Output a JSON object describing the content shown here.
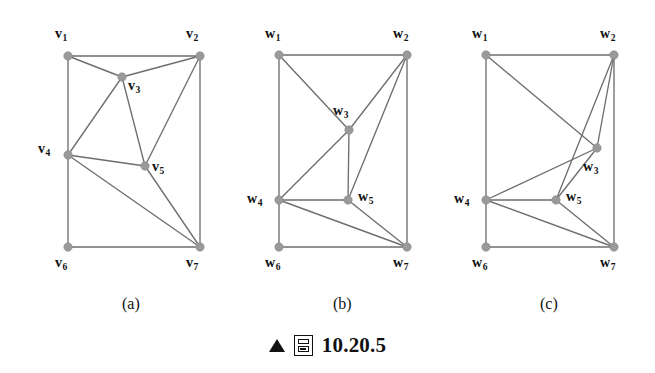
{
  "figure": {
    "caption": {
      "triangle_marker": "triangle-up-marker",
      "box_icon": "figure-box-icon",
      "number": "10.20.5"
    },
    "subfigures": [
      {
        "id": "a",
        "label": "(a)",
        "label_x": 122,
        "label_y": 295,
        "vertex_prefix": "v",
        "vertices": [
          {
            "name": "v1",
            "label": "v",
            "sub": "1",
            "x": 68,
            "y": 56,
            "lx": 55,
            "ly": 27
          },
          {
            "name": "v2",
            "label": "v",
            "sub": "2",
            "x": 200,
            "y": 56,
            "lx": 186,
            "ly": 27
          },
          {
            "name": "v3",
            "label": "v",
            "sub": "3",
            "x": 122,
            "y": 77,
            "lx": 128,
            "ly": 79
          },
          {
            "name": "v4",
            "label": "v",
            "sub": "4",
            "x": 68,
            "y": 155,
            "lx": 38,
            "ly": 142
          },
          {
            "name": "v5",
            "label": "v",
            "sub": "5",
            "x": 145,
            "y": 166,
            "lx": 152,
            "ly": 160
          },
          {
            "name": "v6",
            "label": "v",
            "sub": "6",
            "x": 68,
            "y": 247,
            "lx": 55,
            "ly": 256
          },
          {
            "name": "v7",
            "label": "v",
            "sub": "7",
            "x": 200,
            "y": 247,
            "lx": 186,
            "ly": 256
          }
        ],
        "edges": [
          [
            "v1",
            "v2"
          ],
          [
            "v1",
            "v3"
          ],
          [
            "v1",
            "v4"
          ],
          [
            "v2",
            "v3"
          ],
          [
            "v2",
            "v5"
          ],
          [
            "v2",
            "v7"
          ],
          [
            "v3",
            "v4"
          ],
          [
            "v3",
            "v5"
          ],
          [
            "v4",
            "v5"
          ],
          [
            "v4",
            "v6"
          ],
          [
            "v4",
            "v7"
          ],
          [
            "v5",
            "v7"
          ],
          [
            "v6",
            "v7"
          ]
        ]
      },
      {
        "id": "b",
        "label": "(b)",
        "label_x": 333,
        "label_y": 295,
        "vertex_prefix": "w",
        "vertices": [
          {
            "name": "w1",
            "label": "w",
            "sub": "1",
            "x": 279,
            "y": 55,
            "lx": 265,
            "ly": 27
          },
          {
            "name": "w2",
            "label": "w",
            "sub": "2",
            "x": 407,
            "y": 55,
            "lx": 393,
            "ly": 27
          },
          {
            "name": "w3",
            "label": "w",
            "sub": "3",
            "x": 349,
            "y": 130,
            "lx": 333,
            "ly": 104
          },
          {
            "name": "w4",
            "label": "w",
            "sub": "4",
            "x": 279,
            "y": 200,
            "lx": 247,
            "ly": 192
          },
          {
            "name": "w5",
            "label": "w",
            "sub": "5",
            "x": 348,
            "y": 200,
            "lx": 358,
            "ly": 190
          },
          {
            "name": "w6",
            "label": "w",
            "sub": "6",
            "x": 279,
            "y": 247,
            "lx": 265,
            "ly": 256
          },
          {
            "name": "w7",
            "label": "w",
            "sub": "7",
            "x": 407,
            "y": 247,
            "lx": 393,
            "ly": 256
          }
        ],
        "edges": [
          [
            "w1",
            "w2"
          ],
          [
            "w1",
            "w3"
          ],
          [
            "w1",
            "w4"
          ],
          [
            "w2",
            "w3"
          ],
          [
            "w2",
            "w5"
          ],
          [
            "w2",
            "w7"
          ],
          [
            "w3",
            "w4"
          ],
          [
            "w3",
            "w5"
          ],
          [
            "w4",
            "w5"
          ],
          [
            "w4",
            "w6"
          ],
          [
            "w4",
            "w7"
          ],
          [
            "w5",
            "w7"
          ],
          [
            "w6",
            "w7"
          ]
        ]
      },
      {
        "id": "c",
        "label": "(c)",
        "label_x": 540,
        "label_y": 295,
        "vertex_prefix": "w",
        "vertices": [
          {
            "name": "w1",
            "label": "w",
            "sub": "1",
            "x": 486,
            "y": 55,
            "lx": 472,
            "ly": 27
          },
          {
            "name": "w2",
            "label": "w",
            "sub": "2",
            "x": 614,
            "y": 55,
            "lx": 600,
            "ly": 27
          },
          {
            "name": "w3",
            "label": "w",
            "sub": "3",
            "x": 597,
            "y": 148,
            "lx": 583,
            "ly": 160
          },
          {
            "name": "w4",
            "label": "w",
            "sub": "4",
            "x": 486,
            "y": 200,
            "lx": 454,
            "ly": 192
          },
          {
            "name": "w5",
            "label": "w",
            "sub": "5",
            "x": 556,
            "y": 200,
            "lx": 566,
            "ly": 190
          },
          {
            "name": "w6",
            "label": "w",
            "sub": "6",
            "x": 486,
            "y": 247,
            "lx": 472,
            "ly": 256
          },
          {
            "name": "w7",
            "label": "w",
            "sub": "7",
            "x": 614,
            "y": 247,
            "lx": 600,
            "ly": 256
          }
        ],
        "edges": [
          [
            "w1",
            "w2"
          ],
          [
            "w1",
            "w3"
          ],
          [
            "w1",
            "w4"
          ],
          [
            "w2",
            "w3"
          ],
          [
            "w2",
            "w5"
          ],
          [
            "w2",
            "w7"
          ],
          [
            "w3",
            "w4"
          ],
          [
            "w3",
            "w5"
          ],
          [
            "w4",
            "w5"
          ],
          [
            "w4",
            "w6"
          ],
          [
            "w4",
            "w7"
          ],
          [
            "w5",
            "w7"
          ],
          [
            "w6",
            "w7"
          ]
        ]
      }
    ],
    "style": {
      "vertex_fill": "#9a9a9a",
      "edge_stroke": "#6e6e6e",
      "background": "#ffffff",
      "vertex_radius": 4.2
    }
  }
}
